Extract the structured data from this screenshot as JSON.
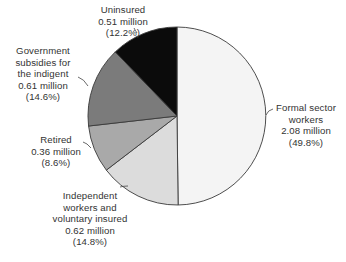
{
  "chart_data": {
    "type": "pie",
    "title": "",
    "start_angle_deg": 0,
    "direction": "clockwise",
    "center": [
      177,
      116
    ],
    "radius": 89,
    "slices": [
      {
        "name": "Formal sector workers",
        "value_millions": 2.08,
        "percent": 49.8,
        "color": "#f4f4f4",
        "label_lines": [
          "Formal sector",
          "workers",
          "2.08 million",
          "(49.8%)"
        ]
      },
      {
        "name": "Independent workers and voluntary insured",
        "value_millions": 0.62,
        "percent": 14.8,
        "color": "#dcdcdc",
        "label_lines": [
          "Independent",
          "workers and",
          "voluntary insured",
          "0.62 million",
          "(14.8%)"
        ]
      },
      {
        "name": "Retired",
        "value_millions": 0.36,
        "percent": 8.6,
        "color": "#a9a9a9",
        "label_lines": [
          "Retired",
          "0.36 million",
          "(8.6%)"
        ]
      },
      {
        "name": "Government subsidies for the indigent",
        "value_millions": 0.61,
        "percent": 14.6,
        "color": "#7b7b7b",
        "label_lines": [
          "Government",
          "subsidies for",
          "the indigent",
          "0.61 million",
          "(14.6%)"
        ]
      },
      {
        "name": "Uninsured",
        "value_millions": 0.51,
        "percent": 12.2,
        "color": "#0b0b0b",
        "label_lines": [
          "Uninsured",
          "0.51 million",
          "(12.2%)"
        ]
      }
    ],
    "legend": "none (direct labels with leader lines)",
    "stroke_color": "#3a3a3a"
  }
}
